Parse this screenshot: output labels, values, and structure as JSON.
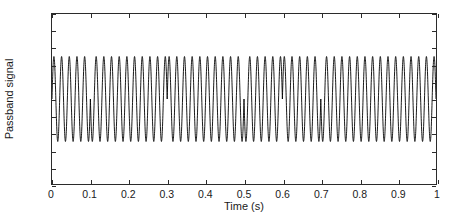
{
  "chart_data": {
    "type": "line",
    "title": "",
    "xlabel": "Time (s)",
    "ylabel": "Passband signal",
    "xlim": [
      0,
      1
    ],
    "ylim": [
      -1,
      1
    ],
    "grid": false,
    "legend": null,
    "line_color": "#000000",
    "line_width": 0.9,
    "x_ticks": [
      0,
      0.1,
      0.2,
      0.3,
      0.4,
      0.5,
      0.6,
      0.7,
      0.8,
      0.9,
      1
    ],
    "x_tick_labels": [
      "0",
      "0.1",
      "0.2",
      "0.3",
      "0.4",
      "0.5",
      "0.6",
      "0.7",
      "0.8",
      "0.9",
      "1"
    ],
    "y_ticks": [
      -1,
      -0.8,
      -0.6,
      -0.4,
      -0.2,
      0,
      0.2,
      0.4,
      0.6,
      0.8,
      1
    ],
    "y_tick_labels": [
      "-1",
      "-0.8",
      "-0.6",
      "-0.4",
      "-0.2",
      "0",
      "0.2",
      "0.4",
      "0.6",
      "0.8",
      "1"
    ],
    "signal": {
      "carrier_frequency_hz": 50,
      "amplitude": 0.5,
      "duration_s": 1,
      "bit_duration_s": 0.05,
      "samples_per_second": 4000,
      "bits": [
        1,
        1,
        1,
        1,
        1,
        1,
        1,
        1,
        1,
        1,
        1,
        1,
        1,
        1,
        1,
        1,
        1,
        1,
        1,
        1
      ],
      "phase_flip_times": [
        0.1,
        0.3,
        0.5,
        0.6,
        0.7
      ],
      "symbol_signs": [
        {
          "t_start": 0.0,
          "t_end": 0.1,
          "sign": 1
        },
        {
          "t_start": 0.1,
          "t_end": 0.3,
          "sign": -1
        },
        {
          "t_start": 0.3,
          "t_end": 0.5,
          "sign": 1
        },
        {
          "t_start": 0.5,
          "t_end": 0.6,
          "sign": -1
        },
        {
          "t_start": 0.6,
          "t_end": 0.7,
          "sign": 1
        },
        {
          "t_start": 0.7,
          "t_end": 1.0,
          "sign": -1
        }
      ]
    }
  }
}
